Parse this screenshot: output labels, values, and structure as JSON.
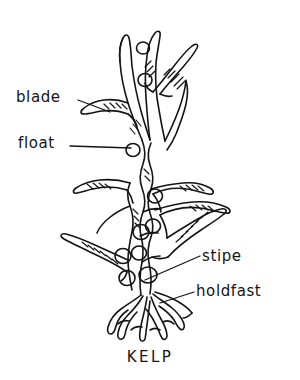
{
  "figure": {
    "subject": "kelp",
    "caption": "KELP",
    "style": "hand-drawn pen and ink line diagram",
    "background_color": "#ffffff",
    "ink_color": "#141414"
  },
  "labels": [
    {
      "id": "blade",
      "text": "blade",
      "side": "left",
      "leader_from": [
        78,
        100
      ],
      "leader_to": [
        110,
        112
      ]
    },
    {
      "id": "float",
      "text": "float",
      "side": "left",
      "leader_from": [
        70,
        146
      ],
      "leader_to": [
        131,
        148
      ]
    },
    {
      "id": "stipe",
      "text": "stipe",
      "side": "right",
      "leader_from": [
        200,
        256
      ],
      "leader_to": [
        145,
        280
      ]
    },
    {
      "id": "holdfast",
      "text": "holdfast",
      "side": "right",
      "leader_from": [
        194,
        292
      ],
      "leader_to": [
        160,
        303
      ]
    }
  ],
  "parts": {
    "blade_label": "blade",
    "float_label": "float",
    "stipe_label": "stipe",
    "holdfast_label": "holdfast"
  }
}
